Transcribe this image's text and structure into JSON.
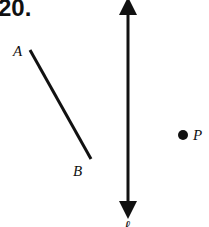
{
  "problem_number": "20.",
  "labels": {
    "point_a": "A",
    "point_b": "B",
    "point_p": "P",
    "line_l": "ℓ"
  },
  "colors": {
    "ink": "#111111",
    "background": "#ffffff"
  }
}
